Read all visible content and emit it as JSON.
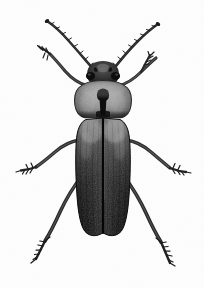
{
  "image": {
    "subject": "beetle",
    "view": "dorsal",
    "style": "monochrome-halftone-specimen-photograph",
    "width_px": 204,
    "height_px": 288,
    "background_color": "#fdfdfd",
    "caption": ""
  },
  "palette": {
    "background": "#fdfdfd",
    "elytra_light": "#9a9a9a",
    "elytra_mid": "#4a4a4a",
    "elytra_dark": "#141414",
    "elytra_black": "#070707",
    "pronotum_light": "#a8a8a8",
    "pronotum_mid": "#6e6e6e",
    "pronotum_dark": "#1a1a1a",
    "head_dark": "#1c1c1c",
    "leg_dark": "#2a2a2a",
    "leg_mid": "#555555",
    "antenna_dark": "#232323",
    "suture_line": "#0a0a0a",
    "shadow": "#c9c9c9"
  },
  "anatomy": {
    "parts": [
      {
        "name": "left-antenna",
        "label": "Left antenna",
        "description": "Long segmented antenna sweeping up and to the left from the head",
        "origin_px": [
          95,
          72
        ],
        "tip_px": [
          47,
          22
        ]
      },
      {
        "name": "right-antenna",
        "label": "Right antenna",
        "description": "Long segmented antenna sweeping up and to the right from the head",
        "origin_px": [
          112,
          72
        ],
        "tip_px": [
          158,
          25
        ]
      },
      {
        "name": "head",
        "label": "Head",
        "description": "Small dark head with prominent lateral eyes, partly retracted under pronotum",
        "bbox_px": [
          88,
          62,
          32,
          22
        ]
      },
      {
        "name": "left-eye",
        "label": "Left compound eye",
        "center_px": [
          92,
          77
        ]
      },
      {
        "name": "right-eye",
        "label": "Right compound eye",
        "center_px": [
          115,
          77
        ]
      },
      {
        "name": "pronotum",
        "label": "Pronotum",
        "description": "Broad rounded shield with a dark keyhole-shaped median marking",
        "bbox_px": [
          74,
          80,
          56,
          38
        ]
      },
      {
        "name": "pronotum-marking",
        "label": "Median pronotal marking",
        "description": "Dark keyhole / anchor shaped mark centered on the pronotum",
        "center_px": [
          103,
          100
        ]
      },
      {
        "name": "scutellum",
        "label": "Scutellum",
        "center_px": [
          103,
          120
        ]
      },
      {
        "name": "left-elytron",
        "label": "Left elytron",
        "description": "Elongate wing case, pale grey at the shoulder grading to black at the apex",
        "bbox_px": [
          76,
          118,
          27,
          118
        ]
      },
      {
        "name": "right-elytron",
        "label": "Right elytron",
        "description": "Elongate wing case, pale grey at the shoulder grading to black at the apex",
        "bbox_px": [
          103,
          118,
          27,
          118
        ]
      },
      {
        "name": "elytral-suture",
        "label": "Elytral suture",
        "description": "Dark midline seam separating the two elytra",
        "from_px": [
          103,
          120
        ],
        "to_px": [
          103,
          234
        ]
      },
      {
        "name": "left-foreleg",
        "label": "Left foreleg",
        "description": "Front leg angled up and out to the left with spiny tarsus",
        "tip_px": [
          40,
          50
        ]
      },
      {
        "name": "right-foreleg",
        "label": "Right foreleg",
        "description": "Front leg angled up and out to the right with spiny tarsus",
        "tip_px": [
          155,
          56
        ]
      },
      {
        "name": "left-midleg",
        "label": "Left middle leg",
        "description": "Middle leg extending laterally left, tarsus pointing outward",
        "tip_px": [
          18,
          172
        ]
      },
      {
        "name": "right-midleg",
        "label": "Right middle leg",
        "description": "Middle leg extending laterally right, tarsus pointing outward",
        "tip_px": [
          186,
          174
        ]
      },
      {
        "name": "left-hindleg",
        "label": "Left hind leg",
        "description": "Long hind leg sweeping down and to the left",
        "tip_px": [
          36,
          262
        ]
      },
      {
        "name": "right-hindleg",
        "label": "Right hind leg",
        "description": "Long hind leg sweeping down and to the right",
        "tip_px": [
          170,
          266
        ]
      }
    ]
  }
}
